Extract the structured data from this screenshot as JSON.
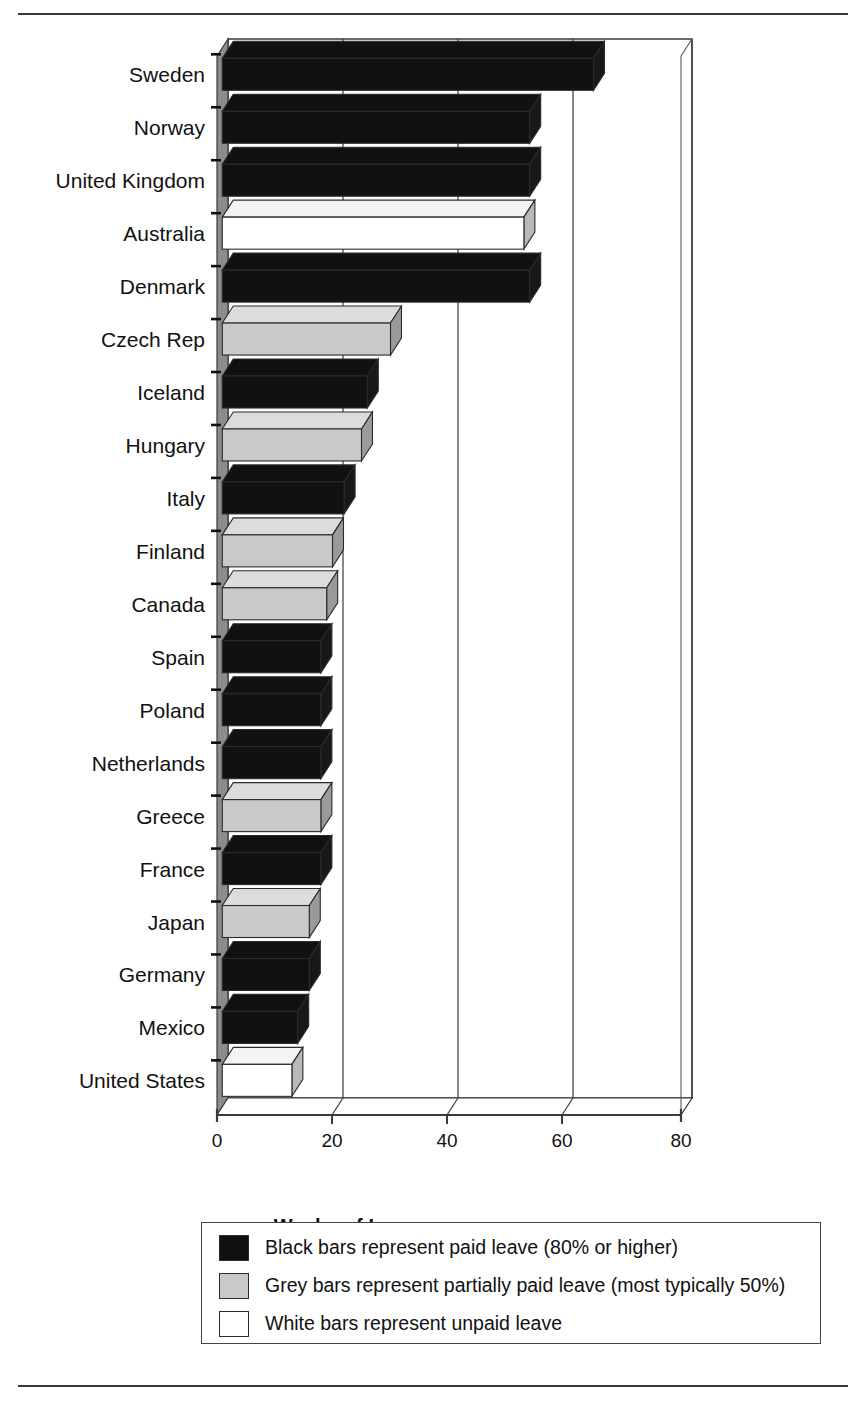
{
  "chart_data": {
    "type": "bar",
    "orientation": "horizontal",
    "title": "",
    "xlabel": "Weeks of Leave",
    "ylabel": "",
    "xlim": [
      0,
      80
    ],
    "xticks": [
      0,
      20,
      40,
      60,
      80
    ],
    "grid": true,
    "legend_position": "below-plot",
    "categories": [
      "Sweden",
      "Norway",
      "United Kingdom",
      "Australia",
      "Denmark",
      "Czech Rep",
      "Iceland",
      "Hungary",
      "Italy",
      "Finland",
      "Canada",
      "Spain",
      "Poland",
      "Netherlands",
      "Greece",
      "France",
      "Japan",
      "Germany",
      "Mexico",
      "United States"
    ],
    "values": [
      64,
      53,
      53,
      52,
      53,
      29,
      25,
      24,
      21,
      19,
      18,
      17,
      17,
      17,
      17,
      17,
      15,
      15,
      13,
      12
    ],
    "bar_types": [
      "black",
      "black",
      "black",
      "white",
      "black",
      "grey",
      "black",
      "grey",
      "black",
      "grey",
      "grey",
      "black",
      "black",
      "black",
      "grey",
      "black",
      "grey",
      "black",
      "black",
      "white"
    ],
    "series": [
      {
        "name": "Paid leave (80% or higher)",
        "color": "#111111",
        "points": [
          {
            "category": "Sweden",
            "value": 64
          },
          {
            "category": "Norway",
            "value": 53
          },
          {
            "category": "United Kingdom",
            "value": 53
          },
          {
            "category": "Denmark",
            "value": 53
          },
          {
            "category": "Iceland",
            "value": 25
          },
          {
            "category": "Italy",
            "value": 21
          },
          {
            "category": "Spain",
            "value": 17
          },
          {
            "category": "Poland",
            "value": 17
          },
          {
            "category": "Netherlands",
            "value": 17
          },
          {
            "category": "France",
            "value": 17
          },
          {
            "category": "Germany",
            "value": 15
          },
          {
            "category": "Mexico",
            "value": 13
          }
        ]
      },
      {
        "name": "Partially paid leave (most typically 50%)",
        "color": "#c9c9c9",
        "points": [
          {
            "category": "Czech Rep",
            "value": 29
          },
          {
            "category": "Hungary",
            "value": 24
          },
          {
            "category": "Finland",
            "value": 19
          },
          {
            "category": "Canada",
            "value": 18
          },
          {
            "category": "Greece",
            "value": 17
          },
          {
            "category": "Japan",
            "value": 15
          }
        ]
      },
      {
        "name": "Unpaid leave",
        "color": "#ffffff",
        "points": [
          {
            "category": "Australia",
            "value": 52
          },
          {
            "category": "United States",
            "value": 12
          }
        ]
      }
    ]
  },
  "axis": {
    "x_title": "Weeks of Leave",
    "ticks": [
      "0",
      "20",
      "40",
      "60",
      "80"
    ]
  },
  "legend": {
    "items": [
      {
        "swatch": "black",
        "color": "#111111",
        "text": "Black bars represent paid leave (80% or higher)"
      },
      {
        "swatch": "grey",
        "color": "#c9c9c9",
        "text": "Grey bars represent partially paid leave (most typically 50%)"
      },
      {
        "swatch": "white",
        "color": "#ffffff",
        "text": "White bars represent unpaid leave"
      }
    ]
  },
  "colors": {
    "black_bar": "#111111",
    "grey_bar": "#c9c9c9",
    "white_bar": "#ffffff",
    "wall": "#8c8c8c",
    "frame_line": "#3a3a3a",
    "rule": "#3a3a3a"
  }
}
